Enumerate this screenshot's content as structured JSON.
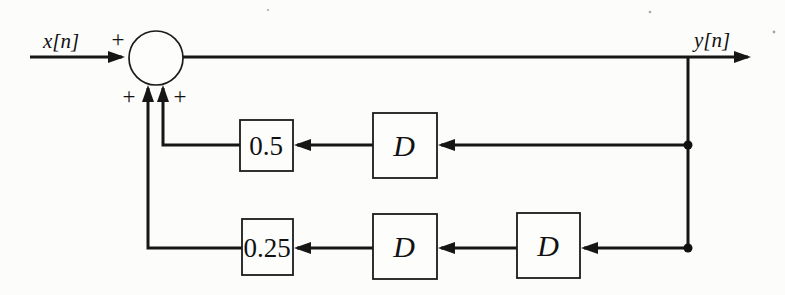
{
  "diagram": {
    "input_label": "x[n]",
    "output_label": "y[n]",
    "summing_junction": {
      "sign_top_left": "+",
      "sign_bottom_left": "+",
      "sign_bottom_right": "+"
    },
    "feedback_paths": [
      {
        "gain": "0.5",
        "delays": [
          "D"
        ]
      },
      {
        "gain": "0.25",
        "delays": [
          "D",
          "D"
        ]
      }
    ]
  }
}
